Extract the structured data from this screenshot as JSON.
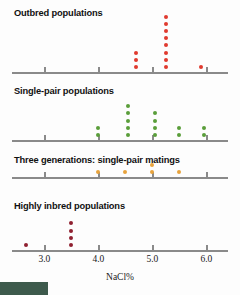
{
  "figure": {
    "x_axis_title": "NaCl%",
    "x_tick_labels": [
      "3.0",
      "4.0",
      "5.0",
      "6.0"
    ],
    "x_tick_values": [
      3.0,
      4.0,
      5.0,
      6.0
    ],
    "colors": {
      "outbred": "#e03a2f",
      "single_pair": "#5a9e3a",
      "three_generations": "#e8a33d",
      "highly_inbred": "#8f2030",
      "axis": "#8a8a8a",
      "text": "#111111",
      "corner_block": "#3d5a4c"
    },
    "panels": [
      {
        "id": "outbred",
        "label": "Outbred populations",
        "color_key": "outbred"
      },
      {
        "id": "single-pair",
        "label": "Single-pair populations",
        "color_key": "single_pair"
      },
      {
        "id": "three-generations",
        "label": "Three generations: single-pair matings",
        "color_key": "three_generations"
      },
      {
        "id": "highly-inbred",
        "label": "Highly inbred populations",
        "color_key": "highly_inbred"
      }
    ]
  },
  "chart_data": {
    "type": "scatter",
    "title": "",
    "xlabel": "NaCl%",
    "ylabel": "",
    "xlim": [
      2.4,
      6.4
    ],
    "grid": false,
    "legend": "none",
    "panel_layout": "4 stacked strip plots sharing one x-axis scale",
    "series": [
      {
        "name": "Outbred populations",
        "color": "#e03a2f",
        "x": [
          4.7,
          4.7,
          4.7,
          5.25,
          5.25,
          5.25,
          5.25,
          5.25,
          5.25,
          5.25,
          5.25,
          5.9
        ],
        "stacks": [
          {
            "x": 4.7,
            "count": 3
          },
          {
            "x": 5.25,
            "count": 8
          },
          {
            "x": 5.9,
            "count": 1
          }
        ]
      },
      {
        "name": "Single-pair populations",
        "color": "#5a9e3a",
        "x": [
          4.0,
          4.0,
          4.55,
          4.55,
          4.55,
          4.55,
          4.55,
          5.05,
          5.05,
          5.05,
          5.05,
          5.5,
          5.5,
          5.95,
          5.95
        ],
        "stacks": [
          {
            "x": 4.0,
            "count": 2
          },
          {
            "x": 4.55,
            "count": 5
          },
          {
            "x": 5.05,
            "count": 4
          },
          {
            "x": 5.5,
            "count": 2
          },
          {
            "x": 5.95,
            "count": 2
          }
        ]
      },
      {
        "name": "Three generations: single-pair matings",
        "color": "#e8a33d",
        "x": [
          4.0,
          4.5,
          5.0,
          5.0,
          5.5
        ],
        "stacks": [
          {
            "x": 4.0,
            "count": 1
          },
          {
            "x": 4.5,
            "count": 1
          },
          {
            "x": 5.0,
            "count": 2
          },
          {
            "x": 5.5,
            "count": 1
          }
        ]
      },
      {
        "name": "Highly inbred populations",
        "color": "#8f2030",
        "x": [
          2.65,
          3.5,
          3.5,
          3.5,
          3.5
        ],
        "stacks": [
          {
            "x": 2.65,
            "count": 1
          },
          {
            "x": 3.5,
            "count": 4
          }
        ]
      }
    ]
  }
}
